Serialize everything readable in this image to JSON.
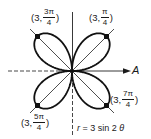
{
  "diagram": {
    "equation": {
      "r_var": "r",
      "rest": " = 3 sin 2 ",
      "theta": "θ"
    },
    "polar_axis_label": "A",
    "center": {
      "x": 72,
      "y": 71
    },
    "petal_length_px": 49,
    "colors": {
      "stroke": "#111111",
      "background": "#ffffff"
    },
    "tip_points": [
      {
        "r": "3",
        "angle_num": "π",
        "angle_den": "4",
        "label_prefix": "(3, ",
        "label_suffix": ")"
      },
      {
        "r": "3",
        "angle_num": "3π",
        "angle_den": "4",
        "label_prefix": "(3, ",
        "label_suffix": ")"
      },
      {
        "r": "3",
        "angle_num": "5π",
        "angle_den": "4",
        "label_prefix": "(3, ",
        "label_suffix": ")"
      },
      {
        "r": "3",
        "angle_num": "7π",
        "angle_den": "4",
        "label_prefix": "(3, ",
        "label_suffix": ")"
      }
    ]
  }
}
